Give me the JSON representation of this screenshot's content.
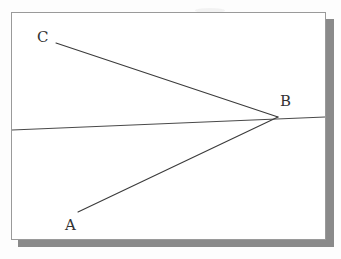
{
  "figure": {
    "type": "geometry-diagram",
    "background_color": "#fdfdfd",
    "card_color": "#ffffff",
    "border_color": "#9a9a9a",
    "shadow_color": "#8a8a8a",
    "line_color": "#3a3a3a",
    "labels": {
      "a": "A",
      "b": "B",
      "c": "C"
    },
    "points": {
      "a": {
        "x": 78,
        "y": 212
      },
      "b": {
        "x": 278,
        "y": 117
      },
      "c": {
        "x": 56,
        "y": 43
      }
    },
    "horizontal_line": {
      "start": {
        "x": 12,
        "y": 130
      },
      "end": {
        "x": 325,
        "y": 117
      }
    },
    "segments": [
      {
        "name": "segment-CB",
        "from": "c",
        "to": "b"
      },
      {
        "name": "segment-AB",
        "from": "a",
        "to": "b"
      }
    ]
  }
}
